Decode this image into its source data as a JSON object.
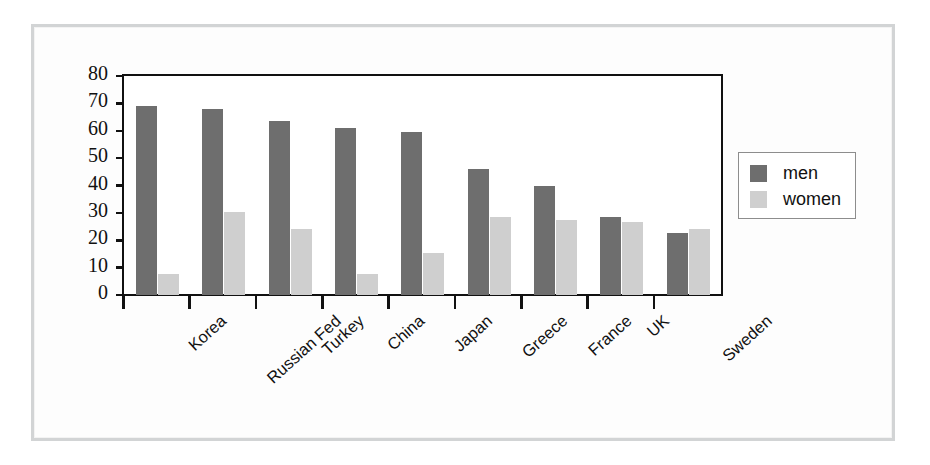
{
  "chart_data": {
    "type": "bar",
    "title": "",
    "subtitle": "",
    "xlabel": "",
    "ylabel": "",
    "ylim": [
      0,
      80
    ],
    "yticks": [
      0,
      10,
      20,
      30,
      40,
      50,
      60,
      70,
      80
    ],
    "ytick_labels": [
      "0",
      "10",
      "20",
      "30",
      "40",
      "50",
      "60",
      "70",
      "80"
    ],
    "grid": false,
    "legend_position": "right",
    "categories": [
      "Korea",
      "Russian Fed",
      "Turkey",
      "China",
      "Japan",
      "Greece",
      "France",
      "UK",
      "Sweden"
    ],
    "series": [
      {
        "name": "men",
        "color": "#6e6e6e",
        "values": [
          69,
          68,
          63.5,
          61,
          59.5,
          46,
          40,
          28.5,
          22.5
        ]
      },
      {
        "name": "women",
        "color": "#cfcfcf",
        "values": [
          7.5,
          30.5,
          24,
          7.5,
          15.5,
          28.5,
          27.5,
          26.5,
          24
        ]
      }
    ]
  },
  "legend": {
    "entries": [
      {
        "label": "men",
        "color": "#6e6e6e"
      },
      {
        "label": "women",
        "color": "#cfcfcf"
      }
    ]
  },
  "colors": {
    "men": "#6e6e6e",
    "women": "#cfcfcf",
    "axis": "#111111",
    "panel_border": "#d2d4d5",
    "page_background": "#ffffff"
  }
}
